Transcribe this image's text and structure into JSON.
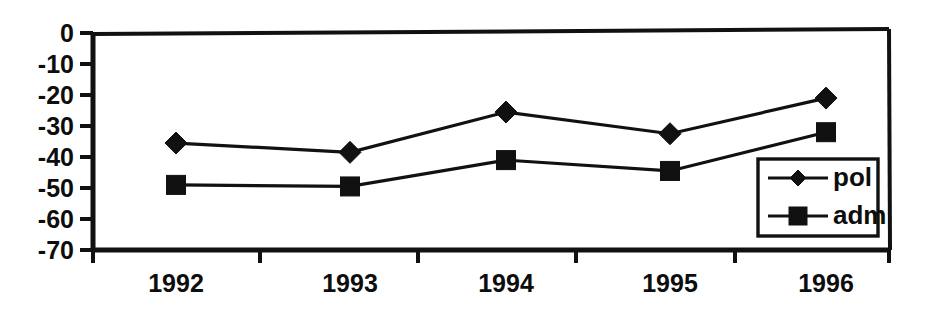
{
  "chart_data": {
    "type": "line",
    "title": "",
    "subtitle": "",
    "xlabel": "",
    "ylabel": "",
    "categories": [
      "1992",
      "1993",
      "1994",
      "1995",
      "1996"
    ],
    "series": [
      {
        "name": "pol",
        "marker": "diamond",
        "values": [
          -35.5,
          -38.5,
          -25.5,
          -32.5,
          -21
        ]
      },
      {
        "name": "adm",
        "marker": "square",
        "values": [
          -49,
          -49.5,
          -41,
          -44.5,
          -32
        ]
      }
    ],
    "ylim": [
      -70,
      0
    ],
    "yticks": [
      0,
      -10,
      -20,
      -30,
      -40,
      -50,
      -60,
      -70
    ],
    "ytick_labels": [
      "0",
      "-10",
      "-20",
      "-30",
      "-40",
      "-50",
      "-60",
      "-70"
    ],
    "xtick_labels": [
      "1992",
      "1993",
      "1994",
      "1995",
      "1996"
    ],
    "grid": false,
    "legend_position": "inside-bottom-right",
    "legend_entries": [
      "pol",
      "adm"
    ],
    "colors": {
      "line": "#111111",
      "marker": "#111111",
      "axis": "#111111",
      "background": "#ffffff",
      "text": "#0d0d0d"
    }
  }
}
